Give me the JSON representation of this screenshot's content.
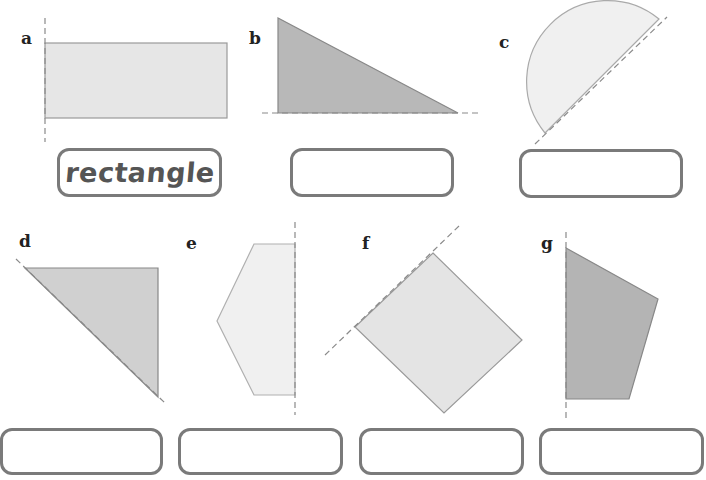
{
  "exercise": {
    "instruction": "Name each shape and its line of symmetry",
    "colors": {
      "light_fill": "#e6e6e6",
      "dark_fill": "#b8b8b8",
      "very_light_fill": "#f0f0f0",
      "stroke": "#999999",
      "dash": "#8a8a8a",
      "box_border": "#7a7a7a"
    },
    "items": [
      {
        "letter": "a",
        "shape_icon": "half-rectangle-shape",
        "answer": "rectangle",
        "placeholder": ""
      },
      {
        "letter": "b",
        "shape_icon": "right-triangle-shape",
        "answer": "",
        "placeholder": ""
      },
      {
        "letter": "c",
        "shape_icon": "semicircle-shape",
        "answer": "",
        "placeholder": ""
      },
      {
        "letter": "d",
        "shape_icon": "right-triangle-diagonal-shape",
        "answer": "",
        "placeholder": ""
      },
      {
        "letter": "e",
        "shape_icon": "half-hexagon-shape",
        "answer": "",
        "placeholder": ""
      },
      {
        "letter": "f",
        "shape_icon": "square-diagonal-shape",
        "answer": "",
        "placeholder": ""
      },
      {
        "letter": "g",
        "shape_icon": "quadrilateral-shape",
        "answer": "",
        "placeholder": ""
      }
    ]
  }
}
